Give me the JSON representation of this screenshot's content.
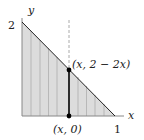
{
  "diagram": {
    "axes": {
      "x_label": "x",
      "y_label": "y",
      "x_tick": "1",
      "y_tick": "2"
    },
    "region": {
      "description": "Triangle bounded by x-axis, y-axis and line y = 2 - 2x",
      "fill_color": "#dcdcdc",
      "hatch_color": "#a8a8a8"
    },
    "labels": {
      "top_point": "(x, 2 − 2x)",
      "bottom_point": "(x, 0)"
    },
    "colors": {
      "axis": "#888888",
      "edge": "#222222",
      "segment": "#000000",
      "dashed": "#aaaaaa"
    }
  }
}
